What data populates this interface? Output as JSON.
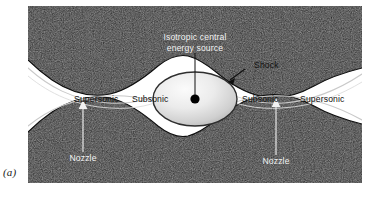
{
  "figure": {
    "caption_label": "(a)",
    "colors": {
      "wall_dark": "#2b2b2b",
      "wall_dark_edge": "#141414",
      "channel_white": "#ffffff",
      "streamline_gray": "#c9c9c9",
      "ellipse_light": "#f4f4f4",
      "ellipse_mid": "#b9b9b9",
      "ellipse_outline": "#2e2e2e",
      "source_dot": "#000000",
      "label_dark": "#111111",
      "label_light": "#f2f2f2"
    }
  },
  "labels": {
    "source": {
      "line1": "Isotropic central",
      "line2": "energy source"
    },
    "shock": "Shock",
    "supersonic_left": "Supersonic",
    "subsonic_left": "Subsonic",
    "subsonic_right": "Subsonic",
    "supersonic_right": "Supersonic",
    "nozzle_left": "Nozzle",
    "nozzle_right": "Nozzle"
  },
  "icons": {
    "source_leader": "leader-line-icon",
    "shock_arrow": "arrow-icon",
    "nozzle_arrow_left": "arrow-up-icon",
    "nozzle_arrow_right": "arrow-up-icon",
    "source_dot": "dot-icon"
  }
}
